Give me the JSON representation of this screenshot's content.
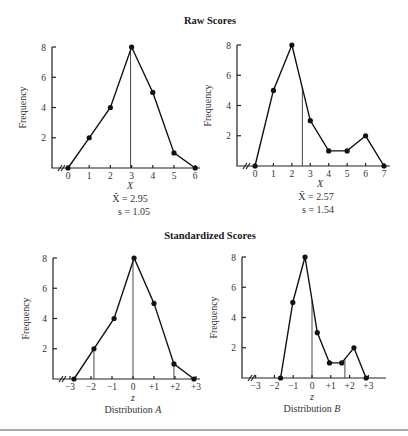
{
  "titles": {
    "raw": "Raw Scores",
    "standardized": "Standardized Scores"
  },
  "ylabel": "Frequency",
  "labels": {
    "raw_x": "X",
    "z_x": "z",
    "dist_a": "Distribution ",
    "dist_a_letter": "A",
    "dist_b": "Distribution ",
    "dist_b_letter": "B",
    "a_mean": "X̄ = 2.95",
    "a_sd": "s = 1.05",
    "b_mean": "X̄ = 2.57",
    "b_sd": "s = 1.54"
  },
  "chart_data": [
    {
      "type": "line",
      "title": "Raw Scores — Distribution A",
      "xlabel": "X",
      "ylabel": "Frequency",
      "x": [
        0,
        1,
        2,
        3,
        4,
        5,
        6
      ],
      "values": [
        0,
        2,
        4,
        8,
        5,
        1,
        0
      ],
      "yticks": [
        2,
        4,
        6,
        8
      ],
      "ylim": [
        0,
        8
      ],
      "mean": 2.95,
      "sd": 1.05,
      "annotations": [
        "X̄ = 2.95",
        "s = 1.05"
      ]
    },
    {
      "type": "line",
      "title": "Raw Scores — Distribution B",
      "xlabel": "X",
      "ylabel": "Frequency",
      "x": [
        0,
        1,
        2,
        3,
        4,
        5,
        6,
        7
      ],
      "values": [
        0,
        5,
        8,
        3,
        1,
        1,
        2,
        0
      ],
      "yticks": [
        2,
        4,
        6,
        8
      ],
      "ylim": [
        0,
        8
      ],
      "mean": 2.57,
      "sd": 1.54,
      "annotations": [
        "X̄ = 2.57",
        "s = 1.54"
      ]
    },
    {
      "type": "line",
      "title": "Standardized Scores — Distribution A",
      "xlabel": "z",
      "ylabel": "Frequency",
      "x": [
        -2.81,
        -1.86,
        -0.9,
        0.05,
        1.0,
        1.95,
        2.9
      ],
      "values": [
        0,
        2,
        4,
        8,
        5,
        1,
        0
      ],
      "xticks": [
        "-3",
        "-2",
        "-1",
        "0",
        "+1",
        "+2",
        "+3"
      ],
      "yticks": [
        2,
        4,
        6,
        8
      ],
      "ylim": [
        0,
        8
      ],
      "drop_lines_z": [
        -1.86,
        0,
        1.95
      ]
    },
    {
      "type": "line",
      "title": "Standardized Scores — Distribution B",
      "xlabel": "z",
      "ylabel": "Frequency",
      "x": [
        -1.67,
        -1.02,
        -0.37,
        0.28,
        0.93,
        1.58,
        2.23,
        2.88
      ],
      "values": [
        0,
        5,
        8,
        3,
        1,
        1,
        2,
        0
      ],
      "xticks": [
        "-3",
        "-2",
        "-1",
        "0",
        "+1",
        "+2",
        "+3"
      ],
      "yticks": [
        2,
        4,
        6,
        8
      ],
      "ylim": [
        0,
        8
      ],
      "drop_lines_z": [
        0,
        1.75
      ]
    }
  ]
}
